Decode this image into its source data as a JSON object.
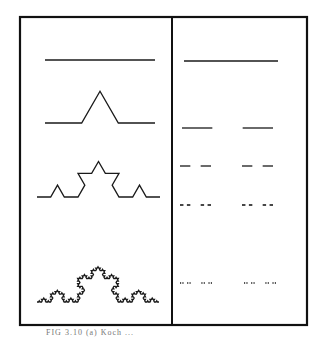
{
  "figure": {
    "frame": {
      "left": 20,
      "top": 17,
      "right": 307,
      "bottom": 325,
      "divider_x": 172,
      "stroke": "#111111"
    },
    "left_panel": {
      "title": "Koch curve construction",
      "rows": [
        {
          "level": 0,
          "x0": 45,
          "x1": 155,
          "y": 60
        },
        {
          "level": 1,
          "x0": 45,
          "x1": 155,
          "y": 123
        },
        {
          "level": 2,
          "x0": 37,
          "x1": 160,
          "y": 197
        },
        {
          "level": 4,
          "x0": 37,
          "x1": 159,
          "y": 302
        }
      ]
    },
    "right_panel": {
      "title": "Cantor set construction",
      "rows": [
        {
          "level": 0,
          "x0": 184,
          "x1": 278,
          "y": 61
        },
        {
          "level": 1,
          "x0": 182,
          "x1": 273,
          "y": 128
        },
        {
          "level": 2,
          "x0": 180,
          "x1": 273,
          "y": 166
        },
        {
          "level": 3,
          "x0": 180,
          "x1": 273,
          "y": 205
        },
        {
          "level": 4,
          "x0": 180,
          "x1": 276,
          "y": 283
        }
      ]
    },
    "caption": "FIG 3.10  (a) Koch ..."
  }
}
